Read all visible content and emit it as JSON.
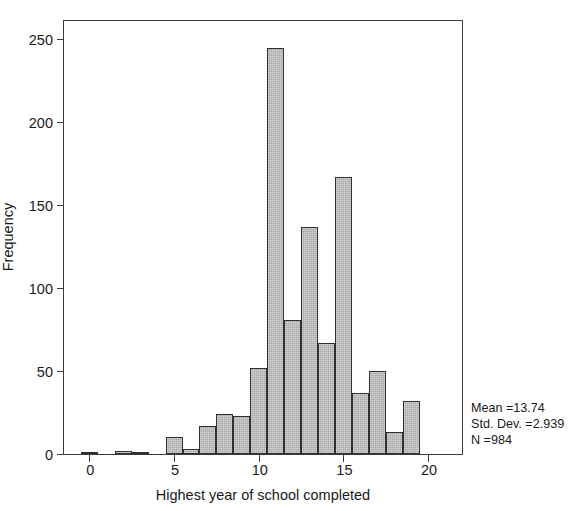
{
  "chart_data": {
    "type": "bar",
    "title": "",
    "subtitle": "",
    "xlabel": "Highest year of school completed",
    "ylabel": "Frequency",
    "xlim": [
      -1.5,
      22.0
    ],
    "ylim": [
      0,
      261
    ],
    "grid": false,
    "legend": null,
    "bin_width": 1,
    "xticks": [
      0,
      5,
      10,
      15,
      20
    ],
    "xtick_labels": [
      "0",
      "5",
      "10",
      "15",
      "20"
    ],
    "yticks": [
      0,
      50,
      100,
      150,
      200,
      250
    ],
    "ytick_labels": [
      "0",
      "50",
      "100",
      "150",
      "200",
      "250"
    ],
    "categories": [
      0,
      1,
      2,
      3,
      4,
      5,
      6,
      7,
      8,
      9,
      10,
      11,
      12,
      13,
      14,
      15,
      16,
      17,
      18,
      19,
      20
    ],
    "values": [
      1,
      0,
      2,
      1,
      0,
      10,
      3,
      17,
      24,
      23,
      52,
      245,
      81,
      137,
      67,
      167,
      37,
      50,
      13,
      32,
      0
    ],
    "bar_color": "#a8a8a8",
    "bar_edge_color": "#2f2f2f",
    "axis_color": "#3b3b3b"
  },
  "annotations": {
    "mean_line": "Mean =13.74",
    "stddev_line": "Std. Dev. =2.939",
    "n_line": "N =984"
  }
}
